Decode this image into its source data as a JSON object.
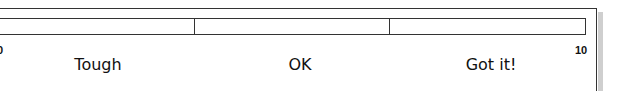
{
  "scale": {
    "min_label": "0",
    "max_label": "10",
    "segments": [
      {
        "label": "Tough"
      },
      {
        "label": "OK"
      },
      {
        "label": "Got it!"
      }
    ]
  },
  "colors": {
    "line": "#333333",
    "shadow": "#cfcfcf",
    "background": "#ffffff"
  }
}
